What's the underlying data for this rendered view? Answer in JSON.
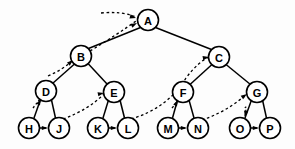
{
  "figure": {
    "kind": "threaded-binary-tree-diagram",
    "width": 295,
    "height": 149,
    "background_color": "#fdfdfd",
    "ink_color": "#000000"
  },
  "nodes": [
    {
      "id": "A",
      "label": "A",
      "cx": 148,
      "cy": 20,
      "r": 10.5,
      "level": 0
    },
    {
      "id": "B",
      "label": "B",
      "cx": 81,
      "cy": 56,
      "r": 10.5,
      "level": 1
    },
    {
      "id": "C",
      "label": "C",
      "cx": 219,
      "cy": 57,
      "r": 10.5,
      "level": 1
    },
    {
      "id": "D",
      "label": "D",
      "cx": 46,
      "cy": 91,
      "r": 10.5,
      "level": 2
    },
    {
      "id": "E",
      "label": "E",
      "cx": 114,
      "cy": 92,
      "r": 10.5,
      "level": 2
    },
    {
      "id": "F",
      "label": "F",
      "cx": 183,
      "cy": 92,
      "r": 10.5,
      "level": 2
    },
    {
      "id": "G",
      "label": "G",
      "cx": 257,
      "cy": 92,
      "r": 10.5,
      "level": 2
    },
    {
      "id": "H",
      "label": "H",
      "cx": 29,
      "cy": 128,
      "r": 10.5,
      "level": 3
    },
    {
      "id": "J",
      "label": "J",
      "cx": 59,
      "cy": 128,
      "r": 10.5,
      "level": 3
    },
    {
      "id": "K",
      "label": "K",
      "cx": 98,
      "cy": 128,
      "r": 10.5,
      "level": 3
    },
    {
      "id": "L",
      "label": "L",
      "cx": 128,
      "cy": 128,
      "r": 10.5,
      "level": 3
    },
    {
      "id": "M",
      "label": "M",
      "cx": 168,
      "cy": 128,
      "r": 10.5,
      "level": 3
    },
    {
      "id": "N",
      "label": "N",
      "cx": 198,
      "cy": 128,
      "r": 10.5,
      "level": 3
    },
    {
      "id": "O",
      "label": "O",
      "cx": 240,
      "cy": 128,
      "r": 10.5,
      "level": 3
    },
    {
      "id": "P",
      "label": "P",
      "cx": 270,
      "cy": 128,
      "r": 10.5,
      "level": 3
    }
  ],
  "child_edges": [
    {
      "from": "A",
      "to": "B",
      "side": "left",
      "d": "M 140.5 27.5 L 88.5 48.5"
    },
    {
      "from": "A",
      "to": "C",
      "side": "right",
      "d": "M 155.5 27.5 L 211.5 49.5"
    },
    {
      "from": "B",
      "to": "D",
      "side": "left",
      "d": "M 74.5 64 L 52.5 83.5"
    },
    {
      "from": "B",
      "to": "E",
      "side": "right",
      "d": "M 88 63.5 L 107.5 84.5"
    },
    {
      "from": "C",
      "to": "F",
      "side": "left",
      "d": "M 212 64.5 L 190 84.5"
    },
    {
      "from": "C",
      "to": "G",
      "side": "right",
      "d": "M 226 64.5 L 250.5 84.5"
    },
    {
      "from": "D",
      "to": "H",
      "side": "left",
      "d": "M 40.5 99.5 L 34 118"
    },
    {
      "from": "D",
      "to": "J",
      "side": "right",
      "d": "M 51.5 100 L 55.5 118"
    },
    {
      "from": "E",
      "to": "K",
      "side": "left",
      "d": "M 108.5 100 L 103 118"
    },
    {
      "from": "E",
      "to": "L",
      "side": "right",
      "d": "M 120 100 L 124.5 118"
    },
    {
      "from": "F",
      "to": "M",
      "side": "left",
      "d": "M 177.5 100 L 172.5 118"
    },
    {
      "from": "F",
      "to": "N",
      "side": "right",
      "d": "M 189 100 L 194 118"
    },
    {
      "from": "G",
      "to": "O",
      "side": "left",
      "d": "M 251.5 100 L 245 118"
    },
    {
      "from": "G",
      "to": "P",
      "side": "right",
      "d": "M 262.5 100 L 266.5 118"
    }
  ],
  "thread_edges": [
    {
      "from": "inorder-predecessor-entry",
      "to": "A",
      "note": "dashed thread arriving at A upper-left, upper curve",
      "d": "M 101 13 Q 122 11 136 17"
    },
    {
      "from": "B",
      "to": "A",
      "note": "dashed thread from B rising to A",
      "d": "M 90 51 Q 118 34 136 21"
    },
    {
      "from": "thread-into-B",
      "to": "B",
      "note": "dashed thread arriving at B from lower-left",
      "d": "M 48 76 Q 62 70 72 61"
    },
    {
      "from": "thread-into-D",
      "to": "D",
      "note": "short dashed thread arriving at D from below-left",
      "d": "M 33 108 Q 37 103 40 99"
    },
    {
      "from": "J",
      "to": "E",
      "note": "dashed thread from J arcing up to E",
      "d": "M 63 119 Q 88 110 104 94"
    },
    {
      "from": "L",
      "to": "C",
      "note": "long dashed thread from L arcing up to C",
      "d": "M 131 119 Q 168 108 186 78 Q 198 62 209 57"
    },
    {
      "from": "thread-into-F",
      "to": "F",
      "note": "short dashed thread arriving at F from below-left",
      "d": "M 172 108 Q 176 103 178 100"
    },
    {
      "from": "N",
      "to": "G",
      "note": "dashed thread from N arcing up to G",
      "d": "M 202 120 Q 226 112 247 94"
    },
    {
      "from": "thread-into-O",
      "to": "O",
      "note": "short dashed thread arriving at O from below-left",
      "d": "M 245 108 Q 247 104 245 117"
    },
    {
      "from": "H",
      "to": "J",
      "note": "short dashed sibling thread H to J",
      "d": "M 40 128 L 48 128"
    },
    {
      "from": "K",
      "to": "L",
      "note": "short dashed sibling thread K to L",
      "d": "M 109 128 L 117 128"
    },
    {
      "from": "M",
      "to": "N",
      "note": "short dashed sibling thread M to N",
      "d": "M 179 128 L 187 128"
    },
    {
      "from": "O",
      "to": "P",
      "note": "short dashed sibling thread O to P",
      "d": "M 251 128 L 259 128"
    }
  ],
  "arrowheads": [
    {
      "target": "A",
      "x": 136,
      "y": 18,
      "angle": 15,
      "name": "arrowhead-into-a-upper"
    },
    {
      "target": "A",
      "x": 137,
      "y": 23,
      "angle": -28,
      "name": "arrowhead-into-a-from-b"
    },
    {
      "target": "B",
      "x": 73,
      "y": 60,
      "angle": -42,
      "name": "arrowhead-into-b"
    },
    {
      "target": "D",
      "x": 41,
      "y": 99,
      "angle": -62,
      "name": "arrowhead-into-d"
    },
    {
      "target": "E",
      "x": 104,
      "y": 93,
      "angle": -12,
      "name": "arrowhead-into-e"
    },
    {
      "target": "C",
      "x": 209,
      "y": 57,
      "angle": -10,
      "name": "arrowhead-into-c"
    },
    {
      "target": "F",
      "x": 178,
      "y": 100,
      "angle": -62,
      "name": "arrowhead-into-f"
    },
    {
      "target": "G",
      "x": 247,
      "y": 94,
      "angle": -35,
      "name": "arrowhead-into-g"
    },
    {
      "target": "O",
      "x": 245,
      "y": 117,
      "angle": 100,
      "name": "arrowhead-into-o"
    },
    {
      "target": "J",
      "x": 48,
      "y": 128,
      "angle": 0,
      "name": "arrowhead-h-to-j"
    },
    {
      "target": "L",
      "x": 117,
      "y": 128,
      "angle": 0,
      "name": "arrowhead-k-to-l"
    },
    {
      "target": "N",
      "x": 187,
      "y": 128,
      "angle": 0,
      "name": "arrowhead-m-to-n"
    },
    {
      "target": "P",
      "x": 259,
      "y": 128,
      "angle": 0,
      "name": "arrowhead-o-to-p"
    }
  ]
}
